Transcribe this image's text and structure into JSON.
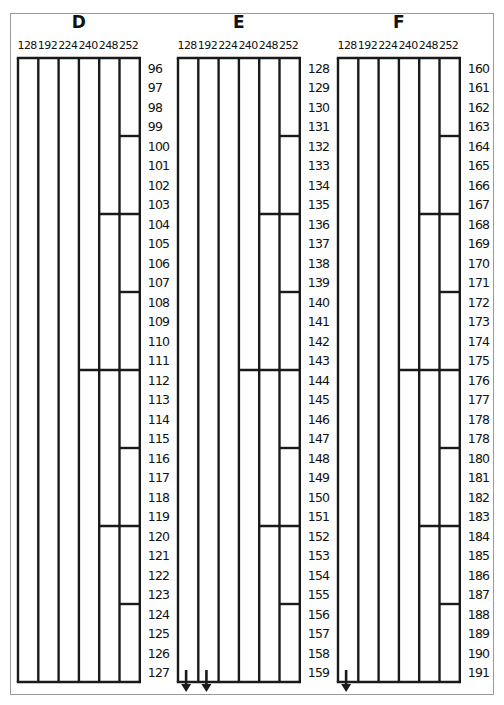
{
  "chart_data": {
    "type": "diagram",
    "mask_columns": [
      "128",
      "192",
      "224",
      "240",
      "248",
      "252"
    ],
    "panels": [
      {
        "title": "D",
        "start": 96,
        "rows": [
          "96",
          "97",
          "98",
          "99",
          "100",
          "101",
          "102",
          "103",
          "104",
          "105",
          "106",
          "107",
          "108",
          "109",
          "110",
          "111",
          "112",
          "113",
          "114",
          "115",
          "116",
          "117",
          "118",
          "119",
          "120",
          "121",
          "122",
          "123",
          "124",
          "125",
          "126",
          "127"
        ],
        "arrows": []
      },
      {
        "title": "E",
        "start": 128,
        "rows": [
          "128",
          "129",
          "130",
          "131",
          "132",
          "133",
          "134",
          "135",
          "136",
          "137",
          "138",
          "139",
          "140",
          "141",
          "142",
          "143",
          "144",
          "145",
          "146",
          "147",
          "148",
          "149",
          "150",
          "151",
          "152",
          "153",
          "154",
          "155",
          "156",
          "157",
          "158",
          "159"
        ],
        "arrows": [
          "128",
          "192"
        ]
      },
      {
        "title": "F",
        "start": 160,
        "rows": [
          "160",
          "161",
          "162",
          "163",
          "164",
          "165",
          "166",
          "167",
          "168",
          "169",
          "170",
          "171",
          "172",
          "173",
          "174",
          "175",
          "176",
          "177",
          "178",
          "178",
          "180",
          "181",
          "182",
          "183",
          "184",
          "185",
          "186",
          "187",
          "188",
          "189",
          "190",
          "191"
        ],
        "arrows": [
          "128"
        ]
      }
    ],
    "boundary_rule": "Horizontal divider before row index i (i>0) spans mask columns whose block size divides i: 252 every 4, 248 every 8, 240 every 16"
  },
  "colors": {
    "line": "#1a1a1a",
    "frame": "#9a9a9a",
    "background": "#ffffff"
  }
}
